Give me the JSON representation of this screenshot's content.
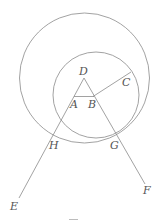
{
  "diagram": {
    "type": "geometry-construction",
    "colors": {
      "line": "#8a8a8a",
      "label": "#555555",
      "background": "#ffffff"
    },
    "points": {
      "D": {
        "label": "D",
        "x": 84,
        "y": 78
      },
      "A": {
        "label": "A",
        "x": 75,
        "y": 96
      },
      "B": {
        "label": "B",
        "x": 93,
        "y": 96
      },
      "C": {
        "label": "C",
        "x": 131,
        "y": 72
      },
      "E": {
        "label": "E",
        "x": 19,
        "y": 198
      },
      "F": {
        "label": "F",
        "x": 145,
        "y": 184
      },
      "G": {
        "label": "G",
        "x": 116,
        "y": 136
      },
      "H": {
        "label": "H",
        "x": 56,
        "y": 135
      }
    },
    "circles": [
      {
        "name": "large-circle",
        "center": "D",
        "cx": 84.5,
        "cy": 78,
        "r": 65
      },
      {
        "name": "small-circle",
        "center": "B",
        "cx": 96,
        "cy": 95,
        "r": 43
      }
    ],
    "segments": [
      {
        "name": "segment-DA-E",
        "from": "D",
        "to": "E"
      },
      {
        "name": "segment-DB-F",
        "from": "D",
        "to": "F"
      },
      {
        "name": "segment-AB",
        "from": "A",
        "to": "B"
      },
      {
        "name": "segment-BC",
        "from": "B",
        "to": "C"
      }
    ]
  },
  "labels": {
    "D": "D",
    "A": "A",
    "B": "B",
    "C": "C",
    "H": "H",
    "G": "G",
    "E": "E",
    "F": "F"
  }
}
